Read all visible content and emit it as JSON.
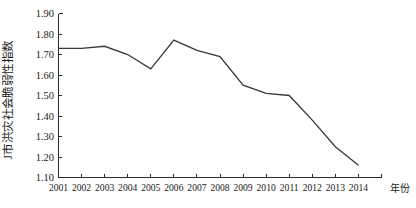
{
  "chart_data": {
    "type": "line",
    "title": "",
    "xlabel": "年份",
    "ylabel": "J市洪灾社会脆弱性指数",
    "categories": [
      "2001",
      "2002",
      "2003",
      "2004",
      "2005",
      "2006",
      "2007",
      "2008",
      "2009",
      "2010",
      "2011",
      "2012",
      "2013",
      "2014"
    ],
    "values": [
      1.73,
      1.73,
      1.74,
      1.7,
      1.63,
      1.77,
      1.72,
      1.69,
      1.55,
      1.51,
      1.5,
      1.38,
      1.25,
      1.16
    ],
    "series": [
      {
        "name": "J市洪灾社会脆弱性指数",
        "values": [
          1.73,
          1.73,
          1.74,
          1.7,
          1.63,
          1.77,
          1.72,
          1.69,
          1.55,
          1.51,
          1.5,
          1.38,
          1.25,
          1.16
        ]
      }
    ],
    "ylim": [
      1.1,
      1.9
    ],
    "ytick_labels": [
      "1.90",
      "1.80",
      "1.70",
      "1.60",
      "1.50",
      "1.40",
      "1.30",
      "1.20",
      "1.10"
    ],
    "ytick_values": [
      1.9,
      1.8,
      1.7,
      1.6,
      1.5,
      1.4,
      1.3,
      1.2,
      1.1
    ],
    "xtick_labels": [
      "2001",
      "2002",
      "2003",
      "2004",
      "2005",
      "2006",
      "2007",
      "2008",
      "2009",
      "2010",
      "2011",
      "2012",
      "2013",
      "2014"
    ],
    "grid": false,
    "legend": "none",
    "line_color": "#3a3a3a",
    "axis_color": "#2b2b2b"
  },
  "axes": {
    "y_axis_title": "J市洪灾社会脆弱性指数",
    "x_axis_title": "年份"
  }
}
